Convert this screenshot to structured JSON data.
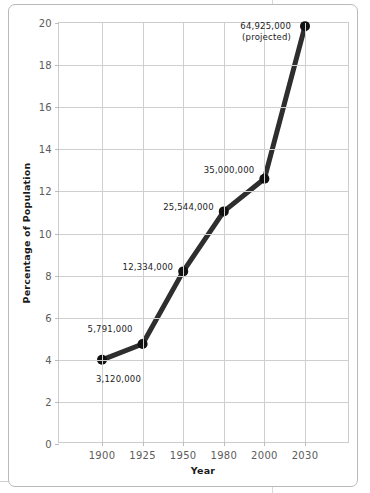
{
  "chart_data": {
    "type": "line",
    "title": "",
    "xlabel": "Year",
    "ylabel": "Percentage of Population",
    "categories": [
      "1900",
      "1925",
      "1950",
      "1980",
      "2000",
      "2030"
    ],
    "values": [
      4.0,
      4.75,
      8.2,
      11.05,
      12.6,
      19.85
    ],
    "point_labels": [
      "3,120,000",
      "5,791,000",
      "12,334,000",
      "25,544,000",
      "35,000,000",
      "64,925,000\n(projected)"
    ],
    "ylim": [
      0,
      20
    ],
    "yticks": [
      "0",
      "2",
      "4",
      "6",
      "8",
      "10",
      "12",
      "14",
      "16",
      "18",
      "20"
    ],
    "ytick_values": [
      0,
      2,
      4,
      6,
      8,
      10,
      12,
      14,
      16,
      18,
      20
    ],
    "xticks": [
      "1900",
      "1925",
      "1950",
      "1980",
      "2000",
      "2030"
    ],
    "grid": true,
    "legend": "none",
    "series": [
      {
        "name": "Percentage of Population",
        "values": [
          4.0,
          4.75,
          8.2,
          11.05,
          12.6,
          19.85
        ]
      }
    ],
    "colors": {
      "line": "#2e2e2e",
      "marker": "#111111",
      "grid": "#cfcfcf",
      "axis_text": "#5c5c5c",
      "label_text": "#1c1c1c",
      "card_border": "#b9b9b9",
      "background": "#ffffff"
    }
  }
}
